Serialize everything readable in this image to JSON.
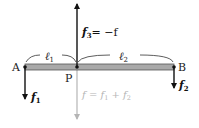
{
  "diagram": {
    "points": {
      "A": {
        "label": "A"
      },
      "B": {
        "label": "B"
      },
      "P": {
        "label": "P"
      }
    },
    "lengths": {
      "l1": {
        "symbol": "ℓ",
        "subscript": "1"
      },
      "l2": {
        "symbol": "ℓ",
        "subscript": "2"
      }
    },
    "forces": {
      "f1": {
        "symbol": "f",
        "subscript": "1",
        "color": "#111111"
      },
      "f2": {
        "symbol": "f",
        "subscript": "2",
        "color": "#111111"
      },
      "f3": {
        "symbol": "f",
        "subscript": "3",
        "equation_rhs": "= −f",
        "color": "#111111"
      },
      "f": {
        "equation": "f = f₁ + f₂",
        "lhs": "f",
        "eq": " = ",
        "t1": "f",
        "t1sub": "1",
        "plus": " + ",
        "t2": "f",
        "t2sub": "2",
        "color": "#b5b5b5"
      }
    },
    "colors": {
      "bar_fill": "#a9a9a9",
      "bar_stroke": "#555555",
      "arrow": "#111111",
      "resultant_arrow": "#b5b5b5"
    }
  }
}
